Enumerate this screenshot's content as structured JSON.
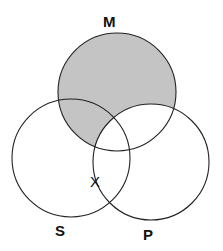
{
  "diagram": {
    "type": "venn",
    "circles": [
      {
        "id": "M",
        "label": "M",
        "cx": 117,
        "cy": 92,
        "r": 59
      },
      {
        "id": "S",
        "label": "S",
        "cx": 71,
        "cy": 158,
        "r": 59
      },
      {
        "id": "P",
        "label": "P",
        "cx": 151,
        "cy": 162,
        "r": 58
      }
    ],
    "shaded_regions": [
      "M not P"
    ],
    "shade_color": "#c4c4c4",
    "stroke_color": "#222222",
    "marker": {
      "text": "X",
      "position": "on boundary of P within S, outside M"
    }
  }
}
